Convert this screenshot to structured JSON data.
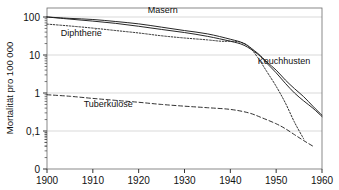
{
  "chart_data": {
    "type": "line",
    "title": "",
    "xlabel": "",
    "ylabel": "Mortalität pro 100 000",
    "yscale": "log",
    "xlim": [
      1900,
      1960
    ],
    "ylim": [
      0.03,
      200
    ],
    "xticks": [
      1900,
      1910,
      1920,
      1930,
      1940,
      1950,
      1960
    ],
    "xticklabels": [
      "1900",
      "1910",
      "1920",
      "1930",
      "1940",
      "1950",
      "1960"
    ],
    "yticks": [
      100,
      10,
      1,
      0.1,
      0
    ],
    "yticklabels": [
      "100",
      "10",
      "1",
      "0,1",
      "0"
    ],
    "grid": true,
    "grid_axis": "y",
    "legend": "inline-annotations",
    "series": [
      {
        "name": "Masern",
        "style": "solid",
        "label_x": 1922,
        "label_y": 150,
        "x": [
          1900,
          1905,
          1910,
          1915,
          1920,
          1925,
          1930,
          1935,
          1940,
          1943,
          1946,
          1948,
          1950,
          1952,
          1954,
          1956,
          1958,
          1960
        ],
        "values": [
          100,
          92,
          86,
          76,
          66,
          54,
          44,
          36,
          26,
          20,
          11,
          6.5,
          4.0,
          2.2,
          1.3,
          0.8,
          0.45,
          0.26
        ]
      },
      {
        "name": "Keuchhusten",
        "style": "solid",
        "label_x": 1946,
        "label_y": 7.0,
        "x": [
          1900,
          1905,
          1910,
          1915,
          1920,
          1925,
          1930,
          1935,
          1940,
          1943,
          1946,
          1948,
          1950,
          1952,
          1954,
          1956,
          1958,
          1960
        ],
        "values": [
          100,
          88,
          78,
          68,
          57,
          47,
          39,
          31,
          23,
          18,
          10.5,
          6.0,
          3.4,
          1.8,
          1.0,
          0.62,
          0.4,
          0.24
        ]
      },
      {
        "name": "Diphtherie",
        "style": "dotted",
        "label_x": 1903,
        "label_y": 38,
        "x": [
          1900,
          1905,
          1910,
          1915,
          1920,
          1925,
          1930,
          1935,
          1938,
          1940,
          1942,
          1944,
          1946,
          1948,
          1950,
          1952,
          1954,
          1956
        ],
        "values": [
          65,
          58,
          51,
          44,
          38,
          32,
          28,
          25,
          23,
          23,
          22,
          17,
          8.5,
          3.6,
          1.5,
          0.55,
          0.17,
          0.062
        ]
      },
      {
        "name": "Tuberkulose",
        "style": "dashed",
        "label_x": 1908,
        "label_y": 0.5,
        "x": [
          1900,
          1905,
          1910,
          1915,
          1920,
          1925,
          1930,
          1935,
          1940,
          1944,
          1947,
          1950,
          1952,
          1954,
          1956,
          1958
        ],
        "values": [
          0.9,
          0.82,
          0.72,
          0.64,
          0.57,
          0.5,
          0.45,
          0.41,
          0.37,
          0.3,
          0.22,
          0.155,
          0.115,
          0.08,
          0.056,
          0.04
        ]
      }
    ]
  },
  "axis": {
    "ylabel": "Mortalität pro 100 000"
  }
}
